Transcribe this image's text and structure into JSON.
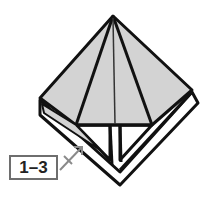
{
  "diagram": {
    "type": "origami-fold-step",
    "step_label": "1–3",
    "colors": {
      "paper_fill": "#d3d3d3",
      "paper_back": "#ffffff",
      "outline": "#111111",
      "arrow": "#8a8a8a",
      "label_border": "#6e6e6e"
    },
    "elements": [
      "folded-paper-kite",
      "center-crease",
      "step-reference-label",
      "reference-arrow"
    ]
  }
}
